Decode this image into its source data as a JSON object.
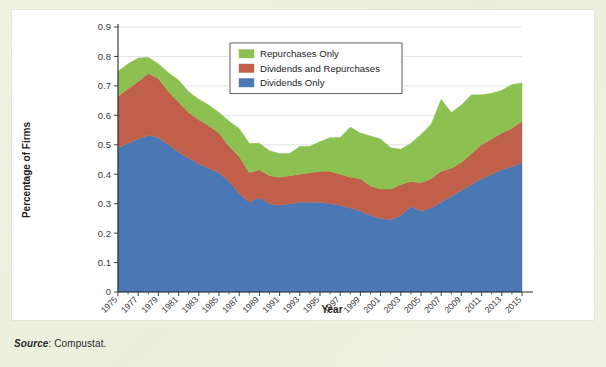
{
  "figure": {
    "source_note_label": "Source",
    "source_note_value": ": Compustat."
  },
  "legend": {
    "position": "top-center",
    "items": [
      {
        "label": "Repurchases Only",
        "color": "#8cc152"
      },
      {
        "label": "Dividends and Repurchases",
        "color": "#c0604a"
      },
      {
        "label": "Dividends Only",
        "color": "#4a78b5"
      }
    ]
  },
  "chart_data": {
    "type": "area",
    "stacked": true,
    "title": "",
    "subtitle": "",
    "xlabel": "Year",
    "ylabel": "Percentage of Firms",
    "xlim": [
      1975,
      2015
    ],
    "ylim": [
      0,
      0.9
    ],
    "grid": true,
    "legend_position": "top-center",
    "ytick_labels": [
      "0",
      "0.1",
      "0.2",
      "0.3",
      "0.4",
      "0.5",
      "0.6",
      "0.7",
      "0.8",
      "0.9"
    ],
    "ytick_values": [
      0,
      0.1,
      0.2,
      0.3,
      0.4,
      0.5,
      0.6,
      0.7,
      0.8,
      0.9
    ],
    "xtick_labels": [
      "1975",
      "1977",
      "1979",
      "1981",
      "1983",
      "1985",
      "1987",
      "1989",
      "1991",
      "1993",
      "1995",
      "1997",
      "1999",
      "2001",
      "2003",
      "2005",
      "2007",
      "2009",
      "2011",
      "2013",
      "2015"
    ],
    "xtick_values": [
      1975,
      1977,
      1979,
      1981,
      1983,
      1985,
      1987,
      1989,
      1991,
      1993,
      1995,
      1997,
      1999,
      2001,
      2003,
      2005,
      2007,
      2009,
      2011,
      2013,
      2015
    ],
    "x": [
      1975,
      1976,
      1977,
      1978,
      1979,
      1980,
      1981,
      1982,
      1983,
      1984,
      1985,
      1986,
      1987,
      1988,
      1989,
      1990,
      1991,
      1992,
      1993,
      1994,
      1995,
      1996,
      1997,
      1998,
      1999,
      2000,
      2001,
      2002,
      2003,
      2004,
      2005,
      2006,
      2007,
      2008,
      2009,
      2010,
      2011,
      2012,
      2013,
      2014,
      2015
    ],
    "series": [
      {
        "name": "Dividends Only",
        "color": "#4a78b5",
        "values": [
          0.49,
          0.505,
          0.52,
          0.532,
          0.525,
          0.5,
          0.475,
          0.455,
          0.435,
          0.42,
          0.405,
          0.375,
          0.335,
          0.305,
          0.32,
          0.3,
          0.295,
          0.3,
          0.305,
          0.305,
          0.305,
          0.3,
          0.295,
          0.285,
          0.275,
          0.26,
          0.25,
          0.245,
          0.26,
          0.29,
          0.275,
          0.285,
          0.305,
          0.325,
          0.345,
          0.365,
          0.385,
          0.4,
          0.415,
          0.425,
          0.44
        ]
      },
      {
        "name": "Dividends and Repurchases",
        "color": "#c0604a",
        "values": [
          0.175,
          0.185,
          0.195,
          0.21,
          0.2,
          0.18,
          0.17,
          0.155,
          0.15,
          0.145,
          0.135,
          0.12,
          0.125,
          0.1,
          0.095,
          0.095,
          0.095,
          0.095,
          0.095,
          0.1,
          0.105,
          0.11,
          0.105,
          0.105,
          0.11,
          0.1,
          0.1,
          0.105,
          0.105,
          0.085,
          0.095,
          0.1,
          0.105,
          0.095,
          0.095,
          0.105,
          0.115,
          0.12,
          0.125,
          0.13,
          0.14
        ]
      },
      {
        "name": "Repurchases Only",
        "color": "#8cc152",
        "values": [
          0.085,
          0.085,
          0.08,
          0.055,
          0.05,
          0.065,
          0.075,
          0.07,
          0.07,
          0.07,
          0.07,
          0.085,
          0.095,
          0.1,
          0.09,
          0.085,
          0.08,
          0.075,
          0.095,
          0.09,
          0.1,
          0.115,
          0.125,
          0.17,
          0.155,
          0.17,
          0.17,
          0.14,
          0.12,
          0.13,
          0.165,
          0.185,
          0.245,
          0.19,
          0.195,
          0.2,
          0.17,
          0.155,
          0.145,
          0.15,
          0.13
        ]
      }
    ],
    "totals": [
      0.75,
      0.775,
      0.795,
      0.797,
      0.775,
      0.745,
      0.72,
      0.68,
      0.655,
      0.635,
      0.61,
      0.58,
      0.555,
      0.51,
      0.505,
      0.48,
      0.47,
      0.47,
      0.495,
      0.495,
      0.51,
      0.51,
      0.525,
      0.56,
      0.54,
      0.53,
      0.52,
      0.49,
      0.485,
      0.505,
      0.535,
      0.57,
      0.655,
      0.61,
      0.635,
      0.67,
      0.67,
      0.675,
      0.685,
      0.705,
      0.71
    ]
  }
}
